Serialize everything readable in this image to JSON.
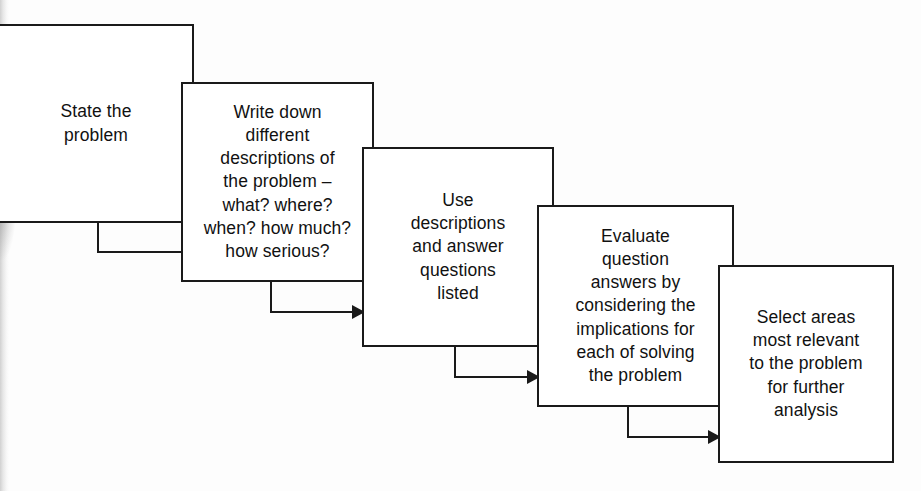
{
  "diagram": {
    "style": {
      "line_color": "#1a1a1a",
      "box_fill": "#ffffff",
      "background": "#fdfdfd"
    },
    "steps": [
      {
        "id": "step-1",
        "order": 1,
        "text": "State the\nproblem"
      },
      {
        "id": "step-2",
        "order": 2,
        "text": "Write down\ndifferent\ndescriptions of\nthe problem –\nwhat? where?\nwhen? how much?\nhow serious?"
      },
      {
        "id": "step-3",
        "order": 3,
        "text": "Use\ndescriptions\nand answer\nquestions\nlisted"
      },
      {
        "id": "step-4",
        "order": 4,
        "text": "Evaluate\nquestion\nanswers by\nconsidering the\nimplications for\neach of solving\nthe problem"
      },
      {
        "id": "step-5",
        "order": 5,
        "text": "Select areas\nmost relevant\nto the problem\nfor further\nanalysis"
      }
    ],
    "connectors": [
      {
        "id": "connector-1-2",
        "from": "step-1",
        "to": "step-2",
        "shape": "down-then-right-arrow"
      },
      {
        "id": "connector-2-3",
        "from": "step-2",
        "to": "step-3",
        "shape": "down-then-right-arrow"
      },
      {
        "id": "connector-3-4",
        "from": "step-3",
        "to": "step-4",
        "shape": "down-then-right-arrow"
      },
      {
        "id": "connector-4-5",
        "from": "step-4",
        "to": "step-5",
        "shape": "down-then-right-arrow"
      }
    ]
  }
}
